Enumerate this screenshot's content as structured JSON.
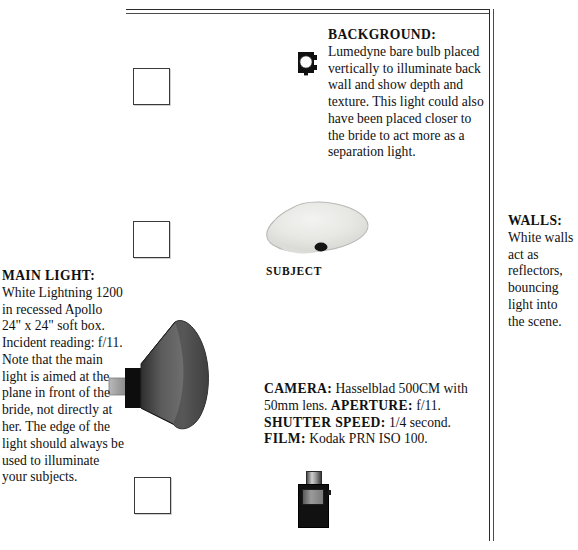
{
  "diagram": {
    "room": {
      "wall_top_name": "back-wall",
      "wall_right_name": "side-wall"
    }
  },
  "captions": {
    "background": {
      "label": "BACKGROUND:",
      "text": " Lumedyne bare bulb placed vertically to illuminate back wall and show depth and texture. This light could also have been placed closer to the bride to act more as a separation light."
    },
    "main_light": {
      "label": "MAIN LIGHT:",
      "text": " White Lightning 1200 in recessed Apollo 24\" x 24\" soft box. Incident reading: f/11. Note that the main light is aimed at the plane in front of the bride, not directly at her. The edge of the light should always be used to illuminate your subjects."
    },
    "camera": {
      "label_camera": "CAMERA:",
      "text_camera": " Hasselblad 500CM with 50mm lens. ",
      "label_aperture": "APERTURE:",
      "text_aperture": " f/11. ",
      "label_shutter": "SHUTTER SPEED:",
      "text_shutter": " 1/4 second. ",
      "label_film": "FILM:",
      "text_film": " Kodak PRN ISO 100."
    },
    "walls": {
      "label": "WALLS:",
      "text": "White walls act as reflectors, bouncing light into the scene."
    }
  },
  "labels": {
    "subject": "SUBJECT"
  },
  "icons": {
    "background_light": "bare-bulb-light-icon",
    "main_light": "softbox-reflector-icon",
    "camera": "camera-icon",
    "subject": "subject-blob-icon",
    "reflector_panels": [
      "reflector-panel-icon",
      "reflector-panel-icon",
      "reflector-panel-icon"
    ]
  },
  "colors": {
    "ink": "#111111",
    "wall_line": "#2b2b2b",
    "panel_fill": "#ffffff",
    "panel_border": "#3a3a3a",
    "light_body": "#111111",
    "cone_dark": "#3d3d3d",
    "cone_light": "#8e8e8e",
    "subject_fill": "#e6e6e4",
    "camera_body": "#111111",
    "camera_lens": "#9b9b9b"
  }
}
